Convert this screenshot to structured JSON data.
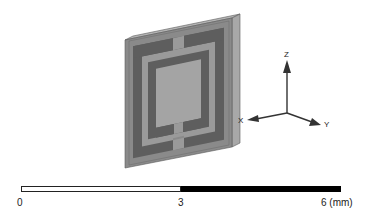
{
  "figure": {
    "colors": {
      "substrate_front": "#8a8a8a",
      "substrate_side": "#a8a8a8",
      "substrate_top": "#b4b4b4",
      "substrate_edge": "#5a5a5a",
      "outer_ring": "#5e5e5e",
      "light_ring": "#9a9a9a",
      "inner_ring": "#5e5e5e",
      "center_patch": "#a4a4a4",
      "axis_color": "#333333"
    }
  },
  "axes": {
    "z_label": "Z",
    "x_label": "X",
    "y_label": "Y"
  },
  "scale_bar": {
    "labels": [
      "0",
      "3",
      "6 (mm)"
    ],
    "unit": "mm",
    "segments": [
      {
        "from": 0,
        "to": 3,
        "color": "#ffffff"
      },
      {
        "from": 3,
        "to": 6,
        "color": "#000000"
      }
    ]
  }
}
